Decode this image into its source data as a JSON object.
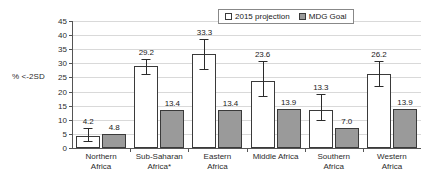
{
  "chart_data": {
    "type": "bar",
    "title": "",
    "xlabel": "",
    "ylabel": "% <-2SD",
    "ylim": [
      0,
      45
    ],
    "yticks": [
      0,
      5,
      10,
      15,
      20,
      25,
      30,
      35,
      40,
      45
    ],
    "grid": true,
    "legend_position": "top-right",
    "categories": [
      "Northern\nAfrica",
      "Sub-Saharan\nAfrica*",
      "Eastern\nAfrica",
      "Middle Africa",
      "Southern\nAfrica",
      "Western\nAfrica"
    ],
    "series": [
      {
        "name": "2015 projection",
        "color": "#ffffff",
        "values": [
          4.2,
          29.2,
          33.3,
          23.6,
          13.3,
          26.2
        ],
        "labels": [
          "4.2",
          "29.2",
          "33.3",
          "23.6",
          "13.3",
          "26.2"
        ],
        "error_low": [
          2.0,
          26.0,
          27.8,
          18.0,
          9.5,
          21.5
        ],
        "error_high": [
          7.0,
          31.5,
          38.5,
          31.0,
          19.0,
          31.0
        ]
      },
      {
        "name": "MDG Goal",
        "color": "#9a9a9a",
        "values": [
          4.8,
          13.4,
          13.4,
          13.9,
          7.0,
          13.9
        ],
        "labels": [
          "4.8",
          "13.4",
          "13.4",
          "13.9",
          "7.0",
          "13.9"
        ],
        "error_low": [
          null,
          null,
          null,
          null,
          null,
          null
        ],
        "error_high": [
          null,
          null,
          null,
          null,
          null,
          null
        ]
      }
    ]
  },
  "legend": {
    "entries": [
      {
        "label": "2015 projection",
        "swatch": "projection-swatch"
      },
      {
        "label": "MDG Goal",
        "swatch": "goal-swatch"
      }
    ]
  },
  "axis": {
    "y_title": "% <-2SD"
  }
}
